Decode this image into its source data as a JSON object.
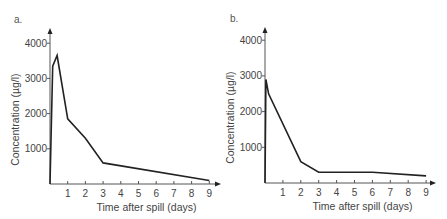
{
  "chart_data": [
    {
      "panel": "a.",
      "type": "line",
      "title": "",
      "xlabel": "Time after spill (days)",
      "ylabel": "Concentration (µg/l)",
      "xlim": [
        0,
        9.5
      ],
      "ylim": [
        0,
        4000
      ],
      "xticks": [
        1,
        2,
        3,
        4,
        5,
        6,
        7,
        8,
        9
      ],
      "yticks": [
        1000,
        2000,
        3000,
        4000
      ],
      "grid": false,
      "legend": null,
      "x": [
        0,
        0.15,
        0.4,
        1,
        2,
        3,
        9
      ],
      "y": [
        0,
        3350,
        3650,
        1850,
        1300,
        600,
        100
      ],
      "series": [
        {
          "name": "Concentration",
          "x": [
            0,
            0.15,
            0.4,
            1,
            2,
            3,
            9
          ],
          "values": [
            0,
            3350,
            3650,
            1850,
            1300,
            600,
            100
          ]
        }
      ]
    },
    {
      "panel": "b.",
      "type": "line",
      "title": "",
      "xlabel": "Time after spill (days)",
      "ylabel": "Concentration (µg/l)",
      "xlim": [
        0,
        9.5
      ],
      "ylim": [
        0,
        4000
      ],
      "xticks": [
        1,
        2,
        3,
        4,
        5,
        6,
        7,
        8,
        9
      ],
      "yticks": [
        1000,
        2000,
        3000,
        4000
      ],
      "grid": false,
      "legend": null,
      "x": [
        0,
        0.05,
        0.2,
        2,
        3,
        6,
        9
      ],
      "y": [
        0,
        2900,
        2500,
        600,
        300,
        300,
        200
      ],
      "series": [
        {
          "name": "Concentration",
          "x": [
            0,
            0.05,
            0.2,
            2,
            3,
            6,
            9
          ],
          "values": [
            0,
            2900,
            2500,
            600,
            300,
            300,
            200
          ]
        }
      ]
    }
  ],
  "panels": [
    {
      "label": "a.",
      "origin_x": 50,
      "origin_y": 184,
      "x_per_day": 17.7,
      "y_per_1000": 35.2,
      "x_axis_end": 221,
      "y_axis_top": 28,
      "label_x": 14,
      "label_y": 23
    },
    {
      "label": "b.",
      "origin_x": 265,
      "origin_y": 183,
      "x_per_day": 17.9,
      "y_per_1000": 35.7,
      "x_axis_end": 436,
      "y_axis_top": 27,
      "label_x": 230,
      "label_y": 22
    }
  ]
}
